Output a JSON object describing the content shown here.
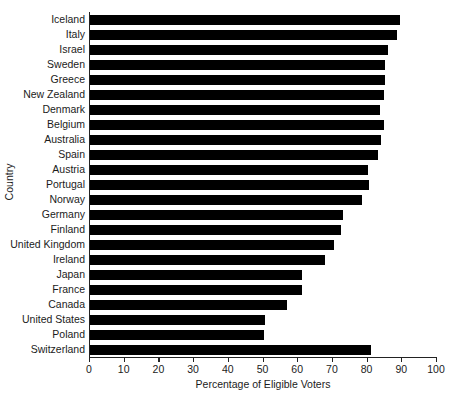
{
  "chart_data": {
    "type": "bar",
    "orientation": "horizontal",
    "title": "",
    "xlabel": "Percentage of Eligible Voters",
    "ylabel": "Country",
    "xlim": [
      0,
      100
    ],
    "xticks": [
      0,
      10,
      20,
      30,
      40,
      50,
      60,
      70,
      80,
      90,
      100
    ],
    "grid": false,
    "legend": null,
    "bar_color": "#000000",
    "axis_color": "#222222",
    "categories": [
      "Iceland",
      "Italy",
      "Israel",
      "Sweden",
      "Greece",
      "New Zealand",
      "Denmark",
      "Belgium",
      "Australia",
      "Spain",
      "Austria",
      "Portugal",
      "Norway",
      "Germany",
      "Finland",
      "United Kingdom",
      "Ireland",
      "Japan",
      "France",
      "Canada",
      "United States",
      "Poland",
      "Switzerland"
    ],
    "values": [
      89.4,
      88.6,
      86.0,
      85.0,
      85.0,
      84.8,
      83.7,
      84.6,
      84.0,
      82.9,
      80.0,
      80.3,
      78.3,
      72.9,
      72.3,
      70.3,
      67.7,
      61.1,
      61.1,
      56.9,
      50.3,
      50.0,
      81.1
    ]
  }
}
